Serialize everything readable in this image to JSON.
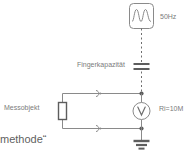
{
  "diagram": {
    "title_fragment": "methode“",
    "labels": {
      "frequency": "50Hz",
      "finger_capacitance": "Fingerkapazität",
      "device_under_test": "Messobjekt",
      "input_resistance": "Ri=10M"
    },
    "icons": {
      "ac_source": "sine-wave-source-icon",
      "capacitor": "capacitor-icon",
      "resistor": "resistor-icon",
      "voltmeter": "voltmeter-icon",
      "ground": "ground-icon",
      "terminal_top": "terminal-connector-icon",
      "terminal_bottom": "terminal-connector-icon"
    },
    "colors": {
      "line": "#8a8a8a",
      "line_dark": "#6e6e6e",
      "text": "#7b7b7b",
      "text_bottom": "#5f5f5f",
      "background": "#ffffff"
    }
  }
}
